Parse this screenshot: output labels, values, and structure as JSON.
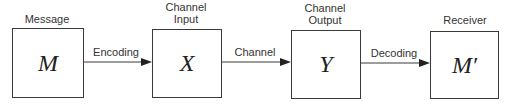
{
  "diagram": {
    "nodes": [
      {
        "id": "message",
        "title": "Message",
        "symbol": "M"
      },
      {
        "id": "channel_input",
        "title_line1": "Channel",
        "title_line2": "Input",
        "symbol": "X"
      },
      {
        "id": "channel_output",
        "title_line1": "Channel",
        "title_line2": "Output",
        "symbol": "Y"
      },
      {
        "id": "receiver",
        "title": "Receiver",
        "symbol": "M′"
      }
    ],
    "edges": [
      {
        "from": "message",
        "to": "channel_input",
        "label": "Encoding"
      },
      {
        "from": "channel_input",
        "to": "channel_output",
        "label": "Channel"
      },
      {
        "from": "channel_output",
        "to": "receiver",
        "label": "Decoding"
      }
    ],
    "colors": {
      "stroke": "#3a3a3a",
      "text": "#333333",
      "background": "#ffffff"
    }
  }
}
